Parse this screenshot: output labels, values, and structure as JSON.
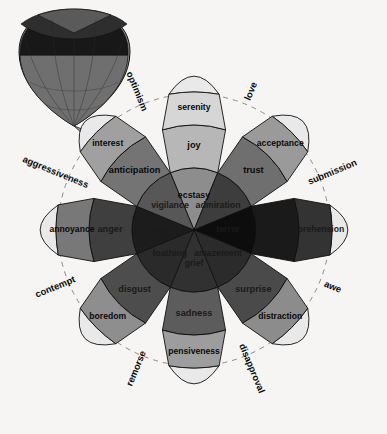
{
  "figure": {
    "background_color": "#f6f5f3",
    "outline_color": "#111111",
    "dashed_ring_color": "#8a8a8a",
    "center": {
      "x": 194,
      "y": 230
    },
    "inset": {
      "name": "three-dimensional-emotion-cone",
      "description": "inverted 3D cone rendering of the wheel",
      "apex": {
        "x": 74,
        "y": 126
      },
      "top_color": "#1a1a1a",
      "mid_color": "#3a3a3a",
      "bottom_color": "#8c8c8c"
    }
  },
  "chart_data": {
    "type": "pie",
    "xlabel": "",
    "ylabel": "",
    "legend_position": "none",
    "grid": false,
    "petals": [
      {
        "id": "joy",
        "angle_deg": -90,
        "petal_color": "#b9b9b9",
        "levels": [
          {
            "rank": 1,
            "label": "ecstasy",
            "intensity": "high",
            "color": "#8d8d8d"
          },
          {
            "rank": 2,
            "label": "joy",
            "intensity": "medium",
            "color": "#b7b7b7"
          },
          {
            "rank": 3,
            "label": "serenity",
            "intensity": "low",
            "color": "#d6d6d6"
          }
        ]
      },
      {
        "id": "trust",
        "angle_deg": -45,
        "petal_color": "#8f8f8f",
        "levels": [
          {
            "rank": 1,
            "label": "admiration",
            "intensity": "high",
            "color": "#3d3d3d"
          },
          {
            "rank": 2,
            "label": "trust",
            "intensity": "medium",
            "color": "#6f6f6f"
          },
          {
            "rank": 3,
            "label": "acceptance",
            "intensity": "low",
            "color": "#9a9a9a"
          }
        ]
      },
      {
        "id": "fear",
        "angle_deg": 0,
        "petal_color": "#2a2a2a",
        "levels": [
          {
            "rank": 1,
            "label": "terror",
            "intensity": "high",
            "color": "#0d0d0d"
          },
          {
            "rank": 2,
            "label": "fear",
            "intensity": "medium",
            "color": "#1a1a1a"
          },
          {
            "rank": 3,
            "label": "apprehension",
            "intensity": "low",
            "color": "#333333"
          }
        ]
      },
      {
        "id": "surprise",
        "angle_deg": 45,
        "petal_color": "#8f8f8f",
        "levels": [
          {
            "rank": 1,
            "label": "amazement",
            "intensity": "high",
            "color": "#2b2b2b"
          },
          {
            "rank": 2,
            "label": "surprise",
            "intensity": "medium",
            "color": "#4a4a4a"
          },
          {
            "rank": 3,
            "label": "distraction",
            "intensity": "low",
            "color": "#8c8c8c"
          }
        ]
      },
      {
        "id": "sadness",
        "angle_deg": 90,
        "petal_color": "#9a9a9a",
        "levels": [
          {
            "rank": 1,
            "label": "grief",
            "intensity": "high",
            "color": "#313131"
          },
          {
            "rank": 2,
            "label": "sadness",
            "intensity": "medium",
            "color": "#5c5c5c"
          },
          {
            "rank": 3,
            "label": "pensiveness",
            "intensity": "low",
            "color": "#9d9d9d"
          }
        ]
      },
      {
        "id": "disgust",
        "angle_deg": 135,
        "petal_color": "#8c8c8c",
        "levels": [
          {
            "rank": 1,
            "label": "loathing",
            "intensity": "high",
            "color": "#2a2a2a"
          },
          {
            "rank": 2,
            "label": "disgust",
            "intensity": "medium",
            "color": "#4d4d4d"
          },
          {
            "rank": 3,
            "label": "boredom",
            "intensity": "low",
            "color": "#8e8e8e"
          }
        ]
      },
      {
        "id": "anger",
        "angle_deg": 180,
        "petal_color": "#6a6a6a",
        "levels": [
          {
            "rank": 1,
            "label": "rage",
            "intensity": "high",
            "color": "#1c1c1c"
          },
          {
            "rank": 2,
            "label": "anger",
            "intensity": "medium",
            "color": "#3f3f3f"
          },
          {
            "rank": 3,
            "label": "annoyance",
            "intensity": "low",
            "color": "#787878"
          }
        ]
      },
      {
        "id": "anticipation",
        "angle_deg": -135,
        "petal_color": "#8b8b8b",
        "levels": [
          {
            "rank": 1,
            "label": "vigilance",
            "intensity": "high",
            "color": "#575757"
          },
          {
            "rank": 2,
            "label": "anticipation",
            "intensity": "medium",
            "color": "#747474"
          },
          {
            "rank": 3,
            "label": "interest",
            "intensity": "low",
            "color": "#a0a0a0"
          }
        ]
      }
    ],
    "dyads": [
      {
        "label": "optimism",
        "angle_deg": -112.5
      },
      {
        "label": "love",
        "angle_deg": -67.5
      },
      {
        "label": "submission",
        "angle_deg": -22.5
      },
      {
        "label": "awe",
        "angle_deg": 22.5
      },
      {
        "label": "disapproval",
        "angle_deg": 67.5
      },
      {
        "label": "remorse",
        "angle_deg": 112.5
      },
      {
        "label": "contempt",
        "angle_deg": 157.5
      },
      {
        "label": "aggressiveness",
        "angle_deg": -157.5
      }
    ]
  }
}
